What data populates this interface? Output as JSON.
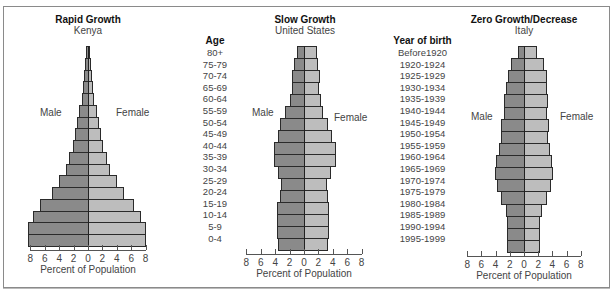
{
  "chart_data": [
    {
      "type": "bar",
      "orientation": "horizontal-population-pyramid",
      "title": "Rapid Growth",
      "subtitle": "Kenya",
      "xlabel": "Percent of Population",
      "ylabel": "Age",
      "left_label": "Male",
      "right_label": "Female",
      "xticks": [
        8,
        6,
        4,
        2,
        0,
        2,
        4,
        6,
        8
      ],
      "xlim": [
        -8,
        8
      ],
      "categories": [
        "80+",
        "75-79",
        "70-74",
        "65-69",
        "60-64",
        "55-59",
        "50-54",
        "45-49",
        "40-44",
        "35-39",
        "30-34",
        "25-29",
        "20-24",
        "15-19",
        "10-14",
        "5-9",
        "0-4"
      ],
      "series": [
        {
          "name": "Male",
          "values": [
            0.3,
            0.4,
            0.5,
            0.7,
            0.9,
            1.2,
            1.5,
            1.8,
            2.1,
            2.6,
            3.1,
            4.0,
            5.0,
            6.6,
            7.6,
            8.3,
            8.3
          ]
        },
        {
          "name": "Female",
          "values": [
            0.3,
            0.4,
            0.5,
            0.7,
            0.9,
            1.2,
            1.5,
            1.8,
            2.1,
            2.6,
            3.1,
            4.0,
            5.0,
            6.4,
            7.4,
            8.0,
            8.0
          ]
        }
      ],
      "grid": false,
      "legend": "none"
    },
    {
      "type": "bar",
      "orientation": "horizontal-population-pyramid",
      "title": "Slow Growth",
      "subtitle": "United States",
      "xlabel": "Percent of Population",
      "left_label": "Male",
      "right_label": "Female",
      "xticks": [
        8,
        6,
        4,
        2,
        0,
        2,
        4,
        6,
        8
      ],
      "xlim": [
        -8,
        8
      ],
      "categories": [
        "80+",
        "75-79",
        "70-74",
        "65-69",
        "60-64",
        "55-59",
        "50-54",
        "45-49",
        "40-44",
        "35-39",
        "30-34",
        "25-29",
        "20-24",
        "15-19",
        "10-14",
        "5-9",
        "0-4"
      ],
      "series": [
        {
          "name": "Male",
          "values": [
            1.0,
            1.4,
            1.7,
            1.7,
            2.0,
            2.6,
            3.3,
            3.6,
            4.1,
            4.1,
            3.6,
            3.2,
            3.4,
            3.7,
            3.7,
            3.7,
            3.6
          ]
        },
        {
          "name": "Female",
          "values": [
            1.8,
            2.0,
            2.2,
            2.1,
            2.3,
            2.7,
            3.4,
            3.9,
            4.4,
            4.4,
            3.8,
            3.2,
            3.3,
            3.5,
            3.5,
            3.5,
            3.4
          ]
        }
      ],
      "grid": false,
      "legend": "none"
    },
    {
      "type": "bar",
      "orientation": "horizontal-population-pyramid",
      "title": "Zero Growth/Decrease",
      "subtitle": "Italy",
      "xlabel": "Percent of Population",
      "left_label": "Male",
      "right_label": "Female",
      "xticks": [
        8,
        6,
        4,
        2,
        0,
        2,
        4,
        6,
        8
      ],
      "xlim": [
        -8,
        8
      ],
      "categories": [
        "80+",
        "75-79",
        "70-74",
        "65-69",
        "60-64",
        "55-59",
        "50-54",
        "45-49",
        "40-44",
        "35-39",
        "30-34",
        "25-29",
        "20-24",
        "15-19",
        "10-14",
        "5-9",
        "0-4"
      ],
      "series": [
        {
          "name": "Male",
          "values": [
            0.9,
            1.8,
            2.2,
            2.5,
            2.8,
            2.8,
            3.2,
            3.2,
            3.5,
            3.9,
            4.1,
            3.8,
            3.2,
            2.6,
            2.4,
            2.4,
            2.4
          ]
        },
        {
          "name": "Female",
          "values": [
            1.9,
            2.8,
            3.2,
            3.3,
            3.4,
            3.3,
            3.5,
            3.4,
            3.6,
            4.0,
            4.1,
            3.8,
            3.2,
            2.5,
            2.3,
            2.2,
            2.2
          ]
        }
      ],
      "grid": false,
      "legend": "none"
    }
  ],
  "charts": [
    {
      "title": "Rapid Growth",
      "subtitle": "Kenya",
      "male": "Male",
      "female": "Female",
      "axis_title": "Percent of Population",
      "ticks": [
        "8",
        "6",
        "4",
        "2",
        "0",
        "2",
        "4",
        "6",
        "8"
      ]
    },
    {
      "title": "Slow Growth",
      "subtitle": "United States",
      "male": "Male",
      "female": "Female",
      "axis_title": "Percent of Population",
      "ticks": [
        "8",
        "6",
        "4",
        "2",
        "0",
        "2",
        "4",
        "6",
        "8"
      ]
    },
    {
      "title": "Zero Growth/Decrease",
      "subtitle": "Italy",
      "male": "Male",
      "female": "Female",
      "axis_title": "Percent of Population",
      "ticks": [
        "8",
        "6",
        "4",
        "2",
        "0",
        "2",
        "4",
        "6",
        "8"
      ]
    }
  ],
  "age_column": {
    "header": "Age",
    "items": [
      "80+",
      "75-79",
      "70-74",
      "65-69",
      "60-64",
      "55-59",
      "50-54",
      "45-49",
      "40-44",
      "35-39",
      "30-34",
      "25-29",
      "20-24",
      "15-19",
      "10-14",
      "5-9",
      "0-4"
    ]
  },
  "birth_column": {
    "header": "Year of birth",
    "items": [
      "Before1920",
      "1920-1924",
      "1925-1929",
      "1930-1934",
      "1935-1939",
      "1940-1944",
      "1945-1949",
      "1950-1954",
      "1955-1959",
      "1960-1964",
      "1965-1969",
      "1970-1974",
      "1975-1979",
      "1980-1984",
      "1985-1989",
      "1990-1994",
      "1995-1999"
    ]
  },
  "colors": {
    "male": "#8a8a8a",
    "female": "#bdbdbd",
    "outline": "#2a2a2a"
  }
}
